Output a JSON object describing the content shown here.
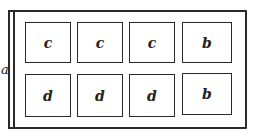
{
  "diagram": {
    "side_label": "a",
    "rows": [
      {
        "cells": [
          "c",
          "c",
          "c",
          "b"
        ]
      },
      {
        "cells": [
          "d",
          "d",
          "d",
          "b"
        ]
      }
    ]
  }
}
